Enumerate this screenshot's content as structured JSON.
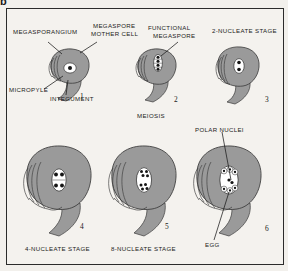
{
  "figure": {
    "panel_letter": "b",
    "title_implied": "Development of the megagametophyte (embryo sac) in an angiosperm ovule",
    "background_color": "#f4f2ee",
    "border_color": "#2b2b2b",
    "tissue_fill_color": "#9a9a9a",
    "tissue_stroke_color": "#3a3a3a",
    "cell_fill_color": "#ffffff",
    "nucleus_color": "#151515"
  },
  "labels": {
    "megasporangium": "MEGASPORANGIUM",
    "megaspore_mother_cell_line1": "MEGASPORE",
    "megaspore_mother_cell_line2": "MOTHER CELL",
    "functional_megaspore_line1": "FUNCTIONAL",
    "functional_megaspore_line2": "MEGASPORE",
    "two_nucleate_stage": "2-NUCLEATE STAGE",
    "micropyle": "MICROPYLE",
    "integument": "INTEGUMENT",
    "meiosis": "MEIOSIS",
    "polar_nuclei": "POLAR NUCLEI",
    "four_nucleate_stage": "4-NUCLEATE STAGE",
    "eight_nucleate_stage": "8-NUCLEATE STAGE",
    "egg": "EGG"
  },
  "stages": [
    {
      "number": "1",
      "name": "megasporangium-with-megaspore-mother-cell",
      "nuclei_count": 1,
      "caption": "",
      "callouts": [
        "MEGASPORANGIUM",
        "MEGASPORE MOTHER CELL",
        "MICROPYLE",
        "INTEGUMENT"
      ]
    },
    {
      "number": "2",
      "name": "functional-megaspore-after-meiosis",
      "nuclei_count": 4,
      "caption": "MEIOSIS",
      "callouts": [
        "FUNCTIONAL MEGASPORE"
      ]
    },
    {
      "number": "3",
      "name": "two-nucleate-stage",
      "nuclei_count": 2,
      "caption": "2-NUCLEATE STAGE",
      "callouts": []
    },
    {
      "number": "4",
      "name": "four-nucleate-stage",
      "nuclei_count": 4,
      "caption": "4-NUCLEATE STAGE",
      "callouts": []
    },
    {
      "number": "5",
      "name": "eight-nucleate-stage",
      "nuclei_count": 8,
      "caption": "8-NUCLEATE STAGE",
      "callouts": []
    },
    {
      "number": "6",
      "name": "mature-embryo-sac",
      "nuclei_count": 8,
      "caption": "",
      "callouts": [
        "POLAR NUCLEI",
        "EGG"
      ]
    }
  ]
}
